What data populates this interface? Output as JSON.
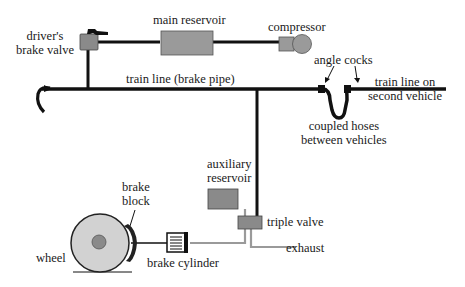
{
  "diagram": {
    "labels": {
      "drivers_brake_valve_line1": "driver's",
      "drivers_brake_valve_line2": "brake valve",
      "main_reservoir": "main reservoir",
      "compressor": "compressor",
      "train_line": "train line (brake pipe)",
      "angle_cocks": "angle cocks",
      "train_line_second_line1": "train line on",
      "train_line_second_line2": "second vehicle",
      "coupled_hoses_line1": "coupled hoses",
      "coupled_hoses_line2": "between vehicles",
      "auxiliary_reservoir_line1": "auxiliary",
      "auxiliary_reservoir_line2": "reservoir",
      "triple_valve": "triple valve",
      "exhaust": "exhaust",
      "brake_block_line1": "brake",
      "brake_block_line2": "block",
      "wheel": "wheel",
      "brake_cylinder": "brake cylinder"
    },
    "colors": {
      "pipe": "#111111",
      "component_fill": "#8c8c8c",
      "wheel_fill": "#d2d2d2",
      "hub_fill": "#8a8a8a",
      "thin_pipe": "#9a9a9a"
    }
  }
}
